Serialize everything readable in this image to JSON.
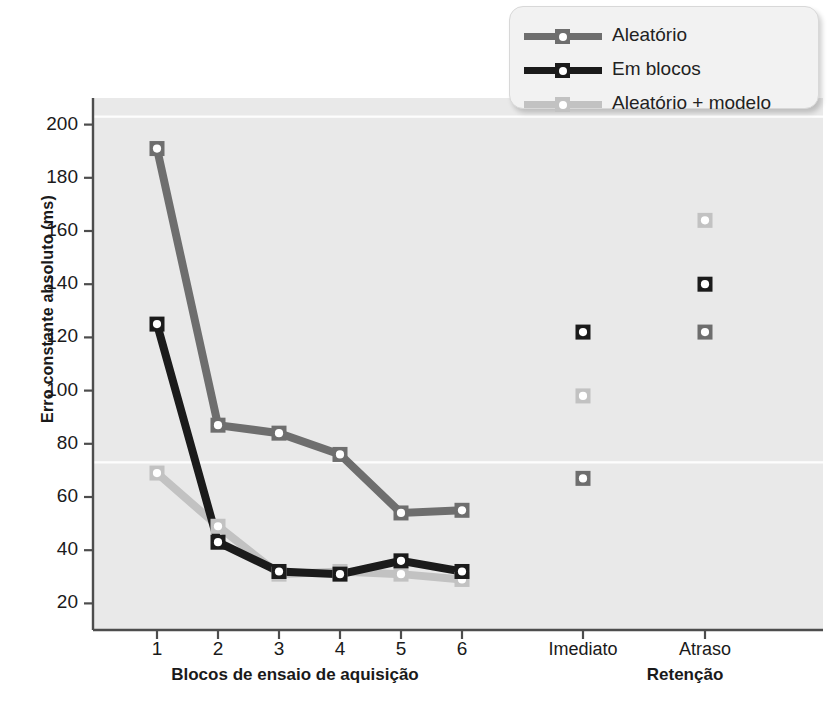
{
  "chart_data": {
    "type": "line",
    "title": "",
    "xlabel": "",
    "ylabel": "Erro constante absoluto (ms)",
    "ylim": [
      10,
      210
    ],
    "yticks": [
      20,
      40,
      60,
      80,
      100,
      120,
      140,
      160,
      180,
      200
    ],
    "grid": "horizontal white gridlines at approx 203 and 73",
    "gridlines": [
      203,
      73
    ],
    "legend_position": "top-right",
    "categories": [
      "1",
      "2",
      "3",
      "4",
      "5",
      "6",
      "Imediato",
      "Atraso"
    ],
    "acquisition_blocks": [
      "1",
      "2",
      "3",
      "4",
      "5",
      "6"
    ],
    "retention_categories": [
      "Imediato",
      "Atraso"
    ],
    "group_labels": {
      "acquisition": "Blocos de ensaio de aquisição",
      "retention": "Retenção"
    },
    "series": [
      {
        "name": "Aleatório",
        "color": "#6e6e6e",
        "acquisition": [
          191,
          87,
          84,
          76,
          54,
          55
        ],
        "retention": [
          67,
          122
        ]
      },
      {
        "name": "Em blocos",
        "color": "#1b1b1b",
        "acquisition": [
          125,
          43,
          32,
          31,
          36,
          32
        ],
        "retention": [
          122,
          140
        ]
      },
      {
        "name": "Aleatório + modelo",
        "color": "#c2c2c2",
        "acquisition": [
          69,
          49,
          31,
          32,
          31,
          29
        ],
        "retention": [
          98,
          164
        ]
      }
    ]
  },
  "legend": {
    "items": [
      {
        "label": "Aleatório",
        "color": "#6e6e6e"
      },
      {
        "label": "Em blocos",
        "color": "#1b1b1b"
      },
      {
        "label": "Aleatório + modelo",
        "color": "#c2c2c2"
      }
    ]
  },
  "axis": {
    "y_title": "Erro constante absoluto (ms)",
    "y_tick_labels": [
      "200",
      "180",
      "160",
      "140",
      "120",
      "100",
      "80",
      "60",
      "40",
      "20"
    ],
    "x_tick_labels": [
      "1",
      "2",
      "3",
      "4",
      "5",
      "6"
    ],
    "x_category_labels": [
      "Imediato",
      "Atraso"
    ],
    "x_group_acquisition": "Blocos de ensaio de aquisição",
    "x_group_retention": "Retenção"
  },
  "colors": {
    "plot_background": "#e9e9e9",
    "page_background": "#ffffff",
    "axis": "#4d4d4d",
    "gridline": "#ffffff",
    "series_random": "#6e6e6e",
    "series_blocked": "#1b1b1b",
    "series_random_model": "#c2c2c2"
  }
}
